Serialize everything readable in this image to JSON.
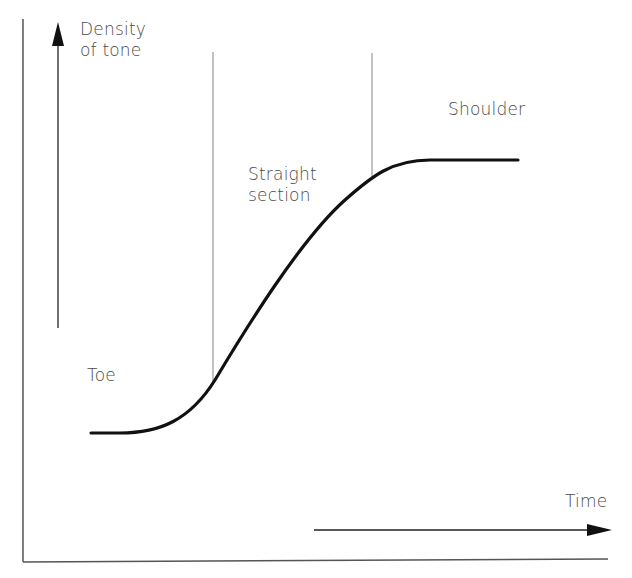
{
  "diagram": {
    "type": "characteristic-curve",
    "y_axis_label": [
      "Density",
      "of tone"
    ],
    "x_axis_label": "Time",
    "regions": {
      "toe": "Toe",
      "straight": [
        "Straight",
        "section"
      ],
      "shoulder": "Shoulder"
    },
    "colors": {
      "curve": "#111111",
      "frame": "#555555",
      "divider": "#9a9a9a",
      "text": "#4a4a4a",
      "background": "#ffffff"
    }
  }
}
